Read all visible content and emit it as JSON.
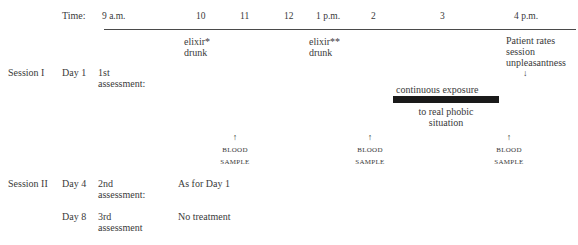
{
  "timeline": {
    "label": "Time:",
    "ticks": [
      "9 a.m.",
      "10",
      "11",
      "12",
      "1 p.m.",
      "2",
      "3",
      "4 p.m."
    ]
  },
  "events": {
    "elixir1": [
      "elixir*",
      "drunk"
    ],
    "elixir2": [
      "elixir**",
      "drunk"
    ],
    "rating": [
      "Patient rates",
      "session",
      "unpleasantness"
    ],
    "exposure_top": "continuous exposure",
    "exposure_bottom": [
      "to real phobic",
      "situation"
    ],
    "blood_sample": [
      "BLOOD",
      "SAMPLE"
    ]
  },
  "rows": [
    {
      "session": "Session I",
      "day": "Day 1",
      "assessment": [
        "1st",
        "assessment:"
      ],
      "treatment": ""
    },
    {
      "session": "Session II",
      "day": "Day 4",
      "assessment": [
        "2nd",
        "assessment:"
      ],
      "treatment": "As for Day 1"
    },
    {
      "session": "",
      "day": "Day 8",
      "assessment": [
        "3rd",
        "assessment"
      ],
      "treatment": "No treatment"
    }
  ],
  "arrows": {
    "up": "↑",
    "down": "↓"
  }
}
